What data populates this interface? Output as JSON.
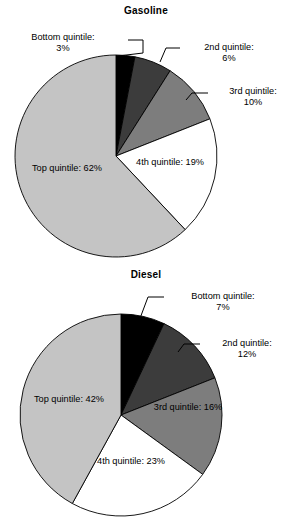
{
  "page": {
    "background": "#ffffff",
    "width": 292,
    "height": 528
  },
  "palette": {
    "bottom_quintile": "#000000",
    "second_quintile": "#3c3c3c",
    "third_quintile": "#7d7d7d",
    "fourth_quintile": "#ffffff",
    "top_quintile": "#c4c4c4",
    "outline": "#000000",
    "text": "#000000"
  },
  "charts": [
    {
      "id": "gasoline",
      "title": "Gasoline",
      "labels": {
        "bottom": {
          "name": "Bottom quintile:",
          "pct": "3%"
        },
        "second": {
          "name": "2nd quintile:",
          "pct": "6%"
        },
        "third": {
          "name": "3rd quintile:",
          "pct": "10%"
        },
        "fourth": {
          "name": "4th quintile:",
          "pct": "19%"
        },
        "top": {
          "name": "Top quintile:",
          "pct": "62%"
        }
      }
    },
    {
      "id": "diesel",
      "title": "Diesel",
      "labels": {
        "bottom": {
          "name": "Bottom quintile:",
          "pct": "7%"
        },
        "second": {
          "name": "2nd quintile:",
          "pct": "12%"
        },
        "third": {
          "name": "3rd quintile:",
          "pct": "16%"
        },
        "fourth": {
          "name": "4th quintile:",
          "pct": "23%"
        },
        "top": {
          "name": "Top quintile:",
          "pct": "42%"
        }
      }
    }
  ],
  "chart_data": [
    {
      "type": "pie",
      "title": "Gasoline",
      "categories": [
        "Bottom quintile",
        "2nd quintile",
        "3rd quintile",
        "4th quintile",
        "Top quintile"
      ],
      "values": [
        3,
        6,
        10,
        19,
        62
      ],
      "value_labels": [
        "3%",
        "6%",
        "10%",
        "19%",
        "62%"
      ],
      "unit": "percent",
      "start_angle_deg": 0,
      "direction": "clockwise",
      "colors": [
        "#000000",
        "#3c3c3c",
        "#7d7d7d",
        "#ffffff",
        "#c4c4c4"
      ],
      "legend": "none",
      "labels_position": [
        "callout",
        "callout",
        "callout",
        "inside",
        "inside"
      ],
      "center": [
        116,
        156
      ],
      "radius": 101
    },
    {
      "type": "pie",
      "title": "Diesel",
      "categories": [
        "Bottom quintile",
        "2nd quintile",
        "3rd quintile",
        "4th quintile",
        "Top quintile"
      ],
      "values": [
        7,
        12,
        16,
        23,
        42
      ],
      "value_labels": [
        "7%",
        "12%",
        "16%",
        "23%",
        "42%"
      ],
      "unit": "percent",
      "start_angle_deg": 0,
      "direction": "clockwise",
      "colors": [
        "#000000",
        "#3c3c3c",
        "#7d7d7d",
        "#ffffff",
        "#c4c4c4"
      ],
      "legend": "none",
      "labels_position": [
        "callout",
        "callout",
        "inside",
        "inside",
        "inside"
      ],
      "center": [
        121,
        151
      ],
      "radius": 101
    }
  ]
}
